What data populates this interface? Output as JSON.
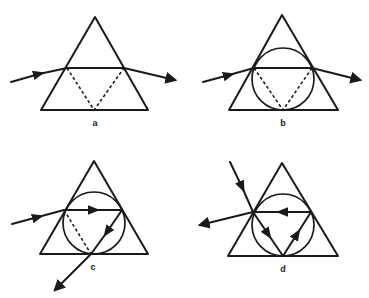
{
  "figure": {
    "panels": [
      {
        "id": "a",
        "label": "a",
        "has_circle": false,
        "description": "Triangle prism with horizontal chord; dashed reflected paths to base midpoint; ray enters left and exits right"
      },
      {
        "id": "b",
        "label": "b",
        "has_circle": true,
        "description": "Triangle with inscribed circle; horizontal chord; dashed paths to base tangent point; ray enters left and exits right"
      },
      {
        "id": "c",
        "label": "c",
        "has_circle": true,
        "description": "Triangle with inscribed circle; ray enters left, travels right along chord, reflects down to base and exits downward-left"
      },
      {
        "id": "d",
        "label": "d",
        "has_circle": true,
        "description": "Triangle with inscribed circle; ray enters from upper-left, travels down to base, up to right, back left along chord and exits left"
      }
    ],
    "colors": {
      "stroke": "#1a1a1a",
      "background": "#ffffff"
    }
  }
}
